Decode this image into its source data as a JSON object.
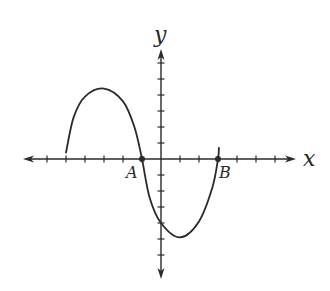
{
  "chart_data": {
    "type": "line",
    "title": "",
    "xlabel": "x",
    "ylabel": "y",
    "xlim": [
      -7,
      7
    ],
    "ylim": [
      -7,
      7
    ],
    "x_ticks": [
      -6,
      -5,
      -4,
      -3,
      -2,
      -1,
      1,
      2,
      3,
      4,
      5,
      6
    ],
    "y_ticks": [
      -6,
      -5,
      -4,
      -3,
      -2,
      -1,
      1,
      2,
      3,
      4,
      5,
      6
    ],
    "tick_labels_shown": false,
    "grid": false,
    "series": [
      {
        "name": "f(x)",
        "points": [
          {
            "x": -5,
            "y": 0.4
          },
          {
            "x": -4.6,
            "y": 2.6
          },
          {
            "x": -4,
            "y": 3.9
          },
          {
            "x": -3,
            "y": 4.4
          },
          {
            "x": -2,
            "y": 3.6
          },
          {
            "x": -1.4,
            "y": 2.0
          },
          {
            "x": -1,
            "y": 0
          },
          {
            "x": -0.6,
            "y": -2.4
          },
          {
            "x": 0,
            "y": -4.0
          },
          {
            "x": 1,
            "y": -4.9
          },
          {
            "x": 2,
            "y": -3.9
          },
          {
            "x": 2.7,
            "y": -1.8
          },
          {
            "x": 3,
            "y": 0
          },
          {
            "x": 3.05,
            "y": 0.7
          }
        ]
      }
    ],
    "annotations": [
      {
        "label": "A",
        "x": -1,
        "y": 0,
        "marker": "dot"
      },
      {
        "label": "B",
        "x": 3,
        "y": 0,
        "marker": "dot"
      }
    ]
  },
  "labels": {
    "x_axis": "x",
    "y_axis": "y",
    "point_a": "A",
    "point_b": "B"
  },
  "colors": {
    "stroke": "#2a2a2a",
    "background": "#ffffff"
  }
}
